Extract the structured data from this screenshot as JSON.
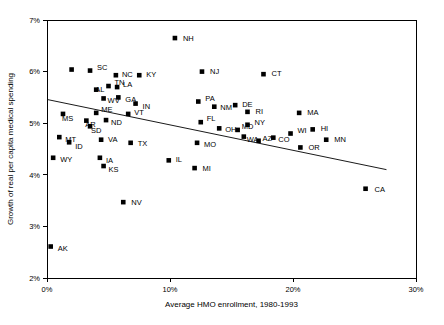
{
  "chart_data": {
    "type": "scatter",
    "title": "",
    "subtitle": "",
    "xlabel": "Average HMO enrollment, 1980-1993",
    "ylabel": "Growth of real per capita medical spending",
    "xlim": [
      0,
      30
    ],
    "ylim": [
      2,
      7
    ],
    "grid": false,
    "legend": null,
    "legend_position": "none",
    "x_unit": "%",
    "y_unit": "%",
    "xticks": [
      0,
      10,
      20,
      30
    ],
    "xtick_labels": [
      "0%",
      "10%",
      "20%",
      "30%"
    ],
    "yticks": [
      2,
      3,
      4,
      5,
      6,
      7
    ],
    "ytick_labels": [
      "2%",
      "3%",
      "4%",
      "5%",
      "6%",
      "7%"
    ],
    "point_labels_enabled": true,
    "series": [
      {
        "name": "States",
        "marker": "square",
        "marker_color": "#000000",
        "points": [
          {
            "label": "NH",
            "x": 10.4,
            "y": 6.65,
            "lx": 8,
            "ly": 3
          },
          {
            "label": "SC",
            "x": 3.5,
            "y": 6.02,
            "lx": 7,
            "ly": -1
          },
          {
            "label": "NC",
            "x": 5.6,
            "y": 5.93,
            "lx": 6,
            "ly": 2
          },
          {
            "label": "KY",
            "x": 7.5,
            "y": 5.93,
            "lx": 7,
            "ly": 2
          },
          {
            "label": "NJ",
            "x": 12.6,
            "y": 6.0,
            "lx": 8,
            "ly": 2
          },
          {
            "label": "CT",
            "x": 17.6,
            "y": 5.95,
            "lx": 8,
            "ly": 2
          },
          {
            "label": "",
            "x": 2.0,
            "y": 6.04,
            "lx": 0,
            "ly": 0
          },
          {
            "label": "TN",
            "x": 5.0,
            "y": 5.72,
            "lx": 6,
            "ly": -1
          },
          {
            "label": "LA",
            "x": 5.7,
            "y": 5.7,
            "lx": 6,
            "ly": 0
          },
          {
            "label": "AL",
            "x": 4.0,
            "y": 5.65,
            "lx": -1,
            "ly": 2
          },
          {
            "label": "WV",
            "x": 4.6,
            "y": 5.48,
            "lx": 4,
            "ly": 5
          },
          {
            "label": "GA",
            "x": 5.8,
            "y": 5.5,
            "lx": 7,
            "ly": 5
          },
          {
            "label": "IN",
            "x": 7.2,
            "y": 5.38,
            "lx": 7,
            "ly": 5
          },
          {
            "label": "PA",
            "x": 12.3,
            "y": 5.42,
            "lx": 7,
            "ly": -1
          },
          {
            "label": "NM",
            "x": 13.6,
            "y": 5.32,
            "lx": 6,
            "ly": 3
          },
          {
            "label": "DE",
            "x": 15.3,
            "y": 5.35,
            "lx": 7,
            "ly": 2
          },
          {
            "label": "MS",
            "x": 1.3,
            "y": 5.18,
            "lx": -1,
            "ly": 7
          },
          {
            "label": "ME",
            "x": 4.0,
            "y": 5.2,
            "lx": 5,
            "ly": -1
          },
          {
            "label": "VT",
            "x": 6.6,
            "y": 5.18,
            "lx": 6,
            "ly": 1
          },
          {
            "label": "AR",
            "x": 3.2,
            "y": 5.05,
            "lx": -1,
            "ly": 6
          },
          {
            "label": "ND",
            "x": 4.8,
            "y": 5.06,
            "lx": 5,
            "ly": 5
          },
          {
            "label": "SD",
            "x": 3.5,
            "y": 4.94,
            "lx": 1,
            "ly": 7
          },
          {
            "label": "RI",
            "x": 16.3,
            "y": 5.22,
            "lx": 8,
            "ly": 2
          },
          {
            "label": "MA",
            "x": 20.5,
            "y": 5.2,
            "lx": 8,
            "ly": 2
          },
          {
            "label": "FL",
            "x": 12.5,
            "y": 5.02,
            "lx": 6,
            "ly": -1
          },
          {
            "label": "OH",
            "x": 14.0,
            "y": 4.9,
            "lx": 6,
            "ly": 4
          },
          {
            "label": "MD",
            "x": 15.5,
            "y": 4.87,
            "lx": 4,
            "ly": -1
          },
          {
            "label": "NY",
            "x": 16.3,
            "y": 4.97,
            "lx": 7,
            "ly": 0
          },
          {
            "label": "WA",
            "x": 16.0,
            "y": 4.74,
            "lx": 3,
            "ly": 5
          },
          {
            "label": "HI",
            "x": 21.6,
            "y": 4.88,
            "lx": 8,
            "ly": 2
          },
          {
            "label": "MT",
            "x": 1.0,
            "y": 4.73,
            "lx": 6,
            "ly": 5
          },
          {
            "label": "ID",
            "x": 1.8,
            "y": 4.63,
            "lx": 6,
            "ly": 7
          },
          {
            "label": "VA",
            "x": 4.4,
            "y": 4.68,
            "lx": 7,
            "ly": 2
          },
          {
            "label": "TX",
            "x": 6.8,
            "y": 4.62,
            "lx": 7,
            "ly": 3
          },
          {
            "label": "MO",
            "x": 12.2,
            "y": 4.62,
            "lx": 7,
            "ly": 4
          },
          {
            "label": "AZ",
            "x": 17.2,
            "y": 4.66,
            "lx": 4,
            "ly": 0
          },
          {
            "label": "CO",
            "x": 18.4,
            "y": 4.72,
            "lx": 5,
            "ly": 4
          },
          {
            "label": "WI",
            "x": 19.8,
            "y": 4.8,
            "lx": 7,
            "ly": -1
          },
          {
            "label": "MN",
            "x": 22.7,
            "y": 4.68,
            "lx": 8,
            "ly": 2
          },
          {
            "label": "OR",
            "x": 20.6,
            "y": 4.53,
            "lx": 8,
            "ly": 3
          },
          {
            "label": "WY",
            "x": 0.5,
            "y": 4.33,
            "lx": 7,
            "ly": 4
          },
          {
            "label": "IA",
            "x": 4.3,
            "y": 4.33,
            "lx": 6,
            "ly": 5
          },
          {
            "label": "KS",
            "x": 4.6,
            "y": 4.17,
            "lx": 5,
            "ly": 6
          },
          {
            "label": "IL",
            "x": 9.9,
            "y": 4.28,
            "lx": 7,
            "ly": 2
          },
          {
            "label": "MI",
            "x": 12.0,
            "y": 4.13,
            "lx": 8,
            "ly": 3
          },
          {
            "label": "NV",
            "x": 6.2,
            "y": 3.47,
            "lx": 8,
            "ly": 3
          },
          {
            "label": "CA",
            "x": 25.9,
            "y": 3.73,
            "lx": 9,
            "ly": 3
          },
          {
            "label": "AK",
            "x": 0.3,
            "y": 2.61,
            "lx": 7,
            "ly": 4
          }
        ]
      }
    ],
    "trend_line": {
      "name": "fitted regression line",
      "x0": 0.0,
      "y0": 5.46,
      "x1": 27.6,
      "y1": 4.1
    }
  }
}
